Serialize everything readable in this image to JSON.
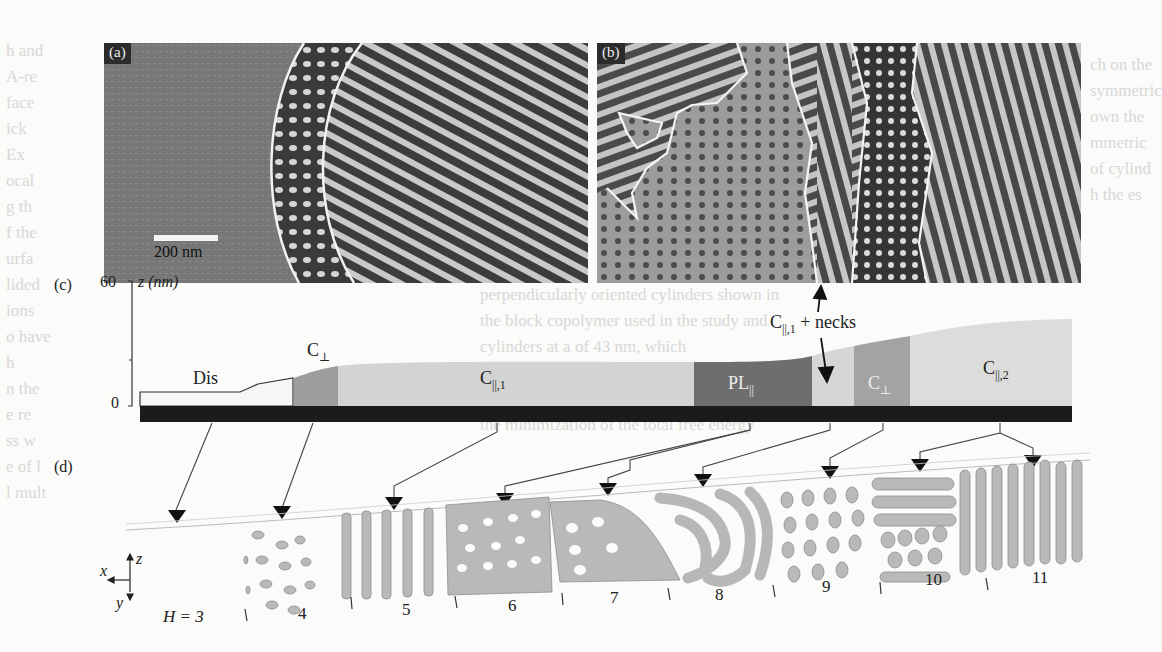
{
  "figure": {
    "panel_a": {
      "tag": "(a)",
      "scale_bar_label": "200 nm",
      "regions": [
        "Dis",
        "C⊥",
        "C||,1"
      ]
    },
    "panel_b": {
      "tag": "(b)",
      "annotation": "C||,1 + necks"
    },
    "panel_c": {
      "tag": "(c)",
      "axis_label": "z (nm)",
      "axis_ticks": [
        "60",
        "0"
      ],
      "regions": [
        {
          "label": "Dis",
          "main": "Dis",
          "sub": ""
        },
        {
          "label": "C⊥",
          "main": "C",
          "sub": "⊥"
        },
        {
          "label": "C||,1",
          "main": "C",
          "sub": "||,1"
        },
        {
          "label": "PL||",
          "main": "PL",
          "sub": "||"
        },
        {
          "label": "C⊥",
          "main": "C",
          "sub": "⊥"
        },
        {
          "label": "C||,2",
          "main": "C",
          "sub": "||,2"
        }
      ],
      "necks_label": {
        "main": "C",
        "sub": "||,1",
        "rest": " + necks"
      }
    },
    "panel_d": {
      "tag": "(d)",
      "axes": {
        "x": "x",
        "y": "y",
        "z": "z"
      },
      "h_prefix": "H = 3",
      "h_values": [
        "4",
        "5",
        "6",
        "7",
        "8",
        "9",
        "10",
        "11"
      ]
    }
  },
  "background_text": {
    "left_col": [
      "h and",
      "A-re",
      "face",
      "ick",
      "Ex",
      "ocal",
      "g th",
      "f the",
      "urfa",
      "lided",
      "ions",
      "o have",
      "h",
      "n the",
      "e re",
      "ss w",
      "e of l",
      "l mult"
    ],
    "mid_col": [
      "perpendicularly oriented cylinders shown in",
      "the block copolymer used in the study and",
      "cylinders at a of 43 nm, which",
      "Using the model stable point of view, the free",
      "of L with   can be expressed",
      "the minimization of the total free energy"
    ],
    "right_col": [
      "ch on the",
      "symmetric",
      "own the",
      "mmetric",
      "of cylind",
      "h the es"
    ]
  },
  "colors": {
    "substrate": "#1c1c1c",
    "dis": "#f7f7f5",
    "c_perp": "#9c9c9c",
    "c_par": "#d2d2d0",
    "pl_par": "#6e6e6e",
    "micelle": "#b8b8b6"
  }
}
